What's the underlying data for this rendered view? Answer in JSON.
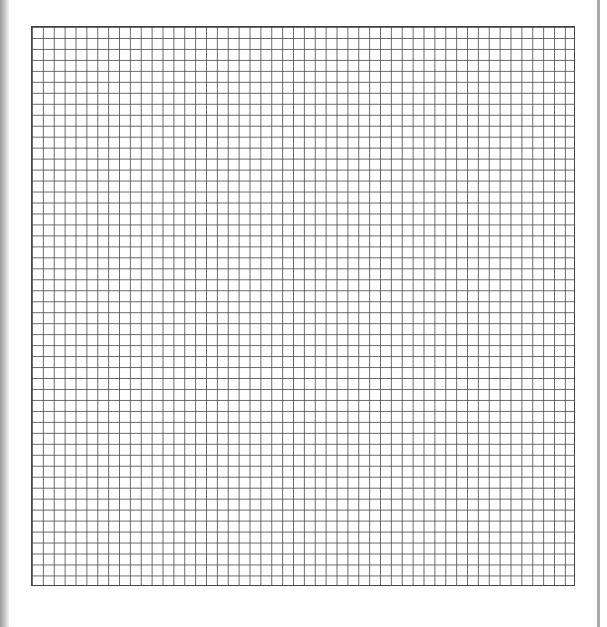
{
  "page": {
    "type": "graph-paper-scan",
    "background_color": "#ffffff",
    "line_color": "#444444"
  },
  "grid": {
    "columns": 50,
    "rows": 51,
    "cell_size_px": 10.9
  }
}
